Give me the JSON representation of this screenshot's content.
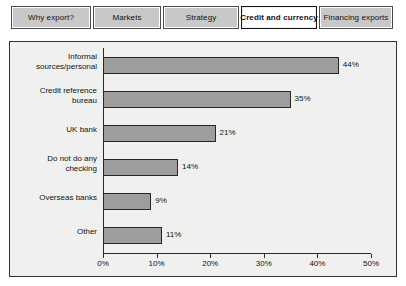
{
  "tabs": [
    {
      "label": "Why export?",
      "active": false
    },
    {
      "label": "Markets",
      "active": false
    },
    {
      "label": "Strategy",
      "active": false
    },
    {
      "label": "Credit and currency",
      "active": true
    },
    {
      "label": "Financing exports",
      "active": false
    }
  ],
  "colors": {
    "bar_fill": "#9d9d9d",
    "bar_stroke": "#272727",
    "panel_bg": "#f0f0ef",
    "panel_border": "#30343a",
    "tab_bg": "#c8c8c8",
    "tab_active_bg": "#ffffff",
    "axis": "#2b2b2b",
    "text": "#111111"
  },
  "chart_data": {
    "type": "bar",
    "orientation": "horizontal",
    "title": "",
    "xlabel": "",
    "ylabel": "",
    "categories": [
      "Informal sources/personal",
      "Credit reference bureau",
      "UK bank",
      "Do not do any checking",
      "Overseas banks",
      "Other"
    ],
    "category_lines": [
      [
        "Informal",
        "sources/personal"
      ],
      [
        "Credit reference",
        "bureau"
      ],
      [
        "UK bank"
      ],
      [
        "Do not do any",
        "checking"
      ],
      [
        "Overseas banks"
      ],
      [
        "Other"
      ]
    ],
    "values": [
      44,
      35,
      21,
      14,
      9,
      11
    ],
    "data_labels": [
      "44%",
      "35%",
      "21%",
      "14%",
      "9%",
      "11%"
    ],
    "xlim": [
      0,
      50
    ],
    "xticks": [
      0,
      10,
      20,
      30,
      40,
      50
    ],
    "xticklabels": [
      "0%",
      "10%",
      "20%",
      "30%",
      "40%",
      "50%"
    ],
    "grid": false,
    "legend": false
  }
}
